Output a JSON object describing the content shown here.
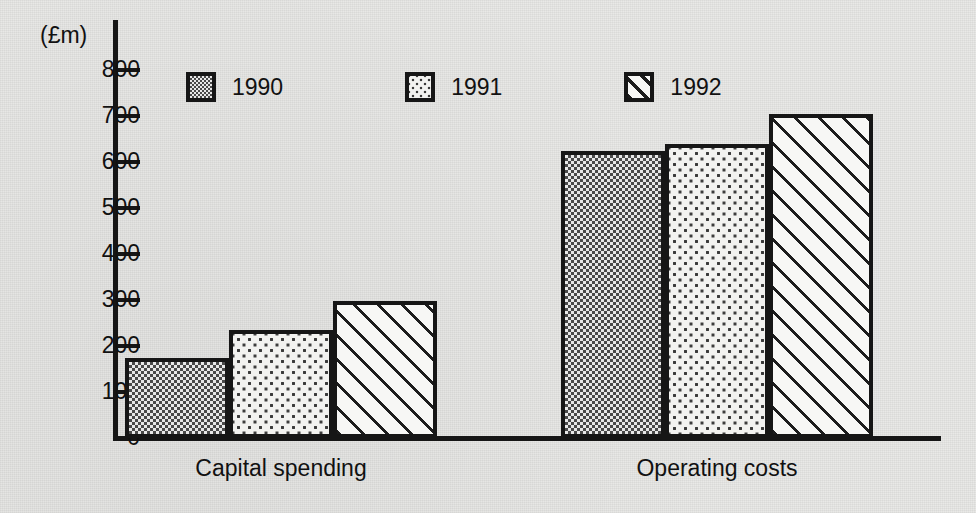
{
  "chart_data": {
    "type": "bar",
    "title": "",
    "subtitle": "",
    "xlabel": "",
    "ylabel": "(£m)",
    "ylim": [
      0,
      800
    ],
    "yticks": [
      0,
      100,
      200,
      300,
      400,
      500,
      600,
      700,
      800
    ],
    "ytick_labels": [
      "0",
      "100",
      "200",
      "300",
      "400",
      "500",
      "600",
      "700",
      "800"
    ],
    "categories": [
      "Capital spending",
      "Operating costs"
    ],
    "grid": false,
    "legend_position": "top-left-inside",
    "series": [
      {
        "name": "1990",
        "values": [
          175,
          625
        ],
        "pattern": "checkerboard",
        "color": "#cfcfcf"
      },
      {
        "name": "1991",
        "values": [
          235,
          640
        ],
        "pattern": "sparse-dots",
        "color": "#f2f2f0"
      },
      {
        "name": "1992",
        "values": [
          297,
          705
        ],
        "pattern": "diagonal-hatch",
        "color": "#f7f7f5"
      }
    ],
    "annotations": []
  },
  "axis": {
    "unit_label": "(£m)"
  },
  "legend": {
    "items": [
      {
        "label": "1990"
      },
      {
        "label": "1991"
      },
      {
        "label": "1992"
      }
    ]
  },
  "groups": [
    {
      "label": "Capital spending"
    },
    {
      "label": "Operating costs"
    }
  ],
  "bars": [
    {
      "group": "Capital spending",
      "series": "1990",
      "value": 175
    },
    {
      "group": "Capital spending",
      "series": "1991",
      "value": 235
    },
    {
      "group": "Capital spending",
      "series": "1992",
      "value": 297
    },
    {
      "group": "Operating costs",
      "series": "1990",
      "value": 625
    },
    {
      "group": "Operating costs",
      "series": "1991",
      "value": 640
    },
    {
      "group": "Operating costs",
      "series": "1992",
      "value": 705
    }
  ]
}
